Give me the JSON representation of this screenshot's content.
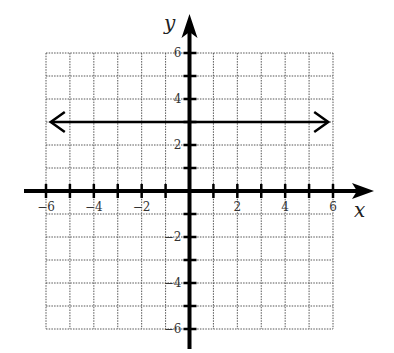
{
  "chart_data": {
    "type": "line",
    "title": "",
    "xlabel": "x",
    "ylabel": "y",
    "xlim": [
      -6,
      6
    ],
    "ylim": [
      -6,
      6
    ],
    "grid": true,
    "grid_step": 1,
    "x_tick_labels": [
      {
        "value": -6,
        "label": "−6"
      },
      {
        "value": -4,
        "label": "−4"
      },
      {
        "value": -2,
        "label": "−2"
      },
      {
        "value": 2,
        "label": "2"
      },
      {
        "value": 4,
        "label": "4"
      },
      {
        "value": 6,
        "label": "6"
      }
    ],
    "y_tick_labels": [
      {
        "value": 6,
        "label": "6"
      },
      {
        "value": 4,
        "label": "4"
      },
      {
        "value": 2,
        "label": "2"
      },
      {
        "value": -2,
        "label": "−2"
      },
      {
        "value": -4,
        "label": "−4"
      },
      {
        "value": -6,
        "label": "−6"
      }
    ],
    "series": [
      {
        "name": "y = 3",
        "equation": "y = 3",
        "x": [
          -5.8,
          5.8
        ],
        "y": [
          3,
          3
        ],
        "arrows": "both",
        "color": "#000000"
      }
    ]
  }
}
